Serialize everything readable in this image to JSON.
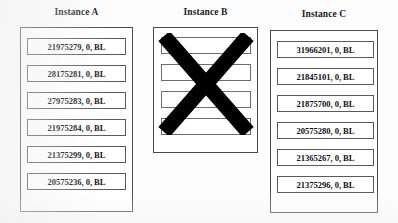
{
  "figure": {
    "background_color": "#ffffff",
    "line_color": "#4a4a4a",
    "text_color": "#111111",
    "cross_color": "#000000"
  },
  "columns": [
    {
      "id": "instance-a",
      "title": "Instance A",
      "struck_out": false,
      "rows": [
        {
          "label": "21975279, 0, BL"
        },
        {
          "label": "28175281, 0, BL"
        },
        {
          "label": "27975283, 0, BL"
        },
        {
          "label": "21975284, 0, BL"
        },
        {
          "label": "21375299, 0, BL"
        },
        {
          "label": "20575236, 0, BL"
        }
      ]
    },
    {
      "id": "instance-b",
      "title": "Instance B",
      "struck_out": true,
      "rows": [
        {
          "label": ""
        },
        {
          "label": ""
        },
        {
          "label": ""
        },
        {
          "label": ""
        }
      ]
    },
    {
      "id": "instance-c",
      "title": "Instance C",
      "struck_out": false,
      "rows": [
        {
          "label": "31966201, 0, BL"
        },
        {
          "label": "21845101, 0, BL"
        },
        {
          "label": "21875700, 0, BL"
        },
        {
          "label": "20575280, 0, BL"
        },
        {
          "label": "21365267, 0, BL"
        },
        {
          "label": "21375296, 0, BL"
        }
      ]
    }
  ]
}
